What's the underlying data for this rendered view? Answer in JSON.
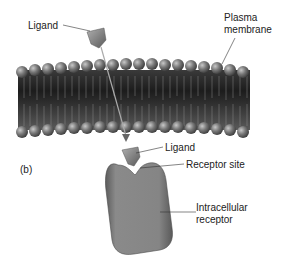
{
  "figure": {
    "panel_label": "(b)",
    "labels": {
      "ligand_top": "Ligand",
      "plasma_membrane_line1": "Plasma",
      "plasma_membrane_line2": "membrane",
      "ligand_bottom": "Ligand",
      "receptor_site": "Receptor site",
      "intracellular_line1": "Intracellular",
      "intracellular_line2": "receptor"
    },
    "colors": {
      "membrane_dark": "#2a2a2a",
      "head": "#7a7a7a",
      "ligand": "#8a8a8a",
      "receptor": "#808080"
    }
  }
}
